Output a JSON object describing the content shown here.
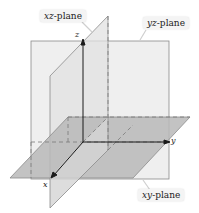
{
  "diagram": {
    "type": "3d-coordinate-planes",
    "planes": [
      {
        "id": "xz",
        "label_var": "xz",
        "label_suffix": "-plane",
        "fill": "#e2e2e2"
      },
      {
        "id": "yz",
        "label_var": "yz",
        "label_suffix": "-plane",
        "fill": "#efefef"
      },
      {
        "id": "xy",
        "label_var": "xy",
        "label_suffix": "-plane",
        "fill": "#b9b9b9"
      }
    ],
    "axes": {
      "x": "x",
      "y": "y",
      "z": "z"
    },
    "colors": {
      "axis": "#1a1a1a",
      "edge": "#8a8a8a",
      "dashed": "#7a7a7a",
      "label_bg": "#f4f4f4"
    }
  }
}
